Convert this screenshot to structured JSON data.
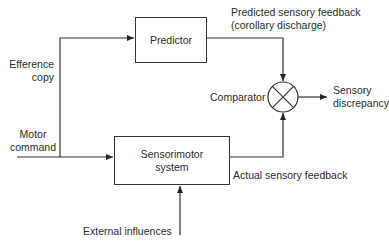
{
  "blocks": {
    "predictor": "Predictor",
    "sensorimotor_line1": "Sensorimotor",
    "sensorimotor_line2": "system"
  },
  "labels": {
    "predicted_line1": "Predicted sensory feedback",
    "predicted_line2": "(corollary discharge)",
    "efference_line1": "Efference",
    "efference_line2": "copy",
    "motor_line1": "Motor",
    "motor_line2": "command",
    "comparator": "Comparator",
    "discrepancy_line1": "Sensory",
    "discrepancy_line2": "discrepancy",
    "actual": "Actual sensory feedback",
    "external": "External influences"
  },
  "colors": {
    "line": "#333333",
    "text": "#2a2a2a",
    "background": "#ffffff"
  }
}
